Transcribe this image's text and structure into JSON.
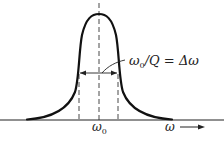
{
  "diagram": {
    "type": "resonance-curve",
    "peak_label": "ω₀",
    "bandwidth_label": "ω₀/Q = Δω",
    "bandwidth_label_parts": {
      "numerator": "ω",
      "numerator_sub": "0",
      "rest": "/Q = Δω"
    },
    "x_axis_label": "ω",
    "x_axis_arrow": "→",
    "center_sub": "0",
    "colors": {
      "curve": "#111111",
      "axis": "#222222",
      "dashed": "#333333",
      "text": "#222222"
    }
  }
}
